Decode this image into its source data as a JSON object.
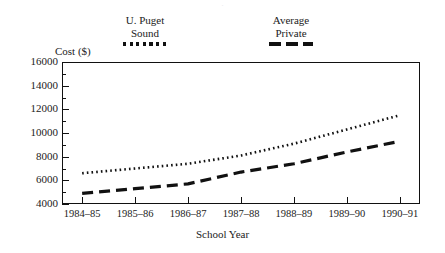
{
  "chart_data": {
    "type": "line",
    "title": "",
    "xlabel": "School Year",
    "ylabel": "Cost ($)",
    "categories": [
      "1984–85",
      "1985–86",
      "1986–87",
      "1987–88",
      "1988–89",
      "1989–90",
      "1990–91"
    ],
    "ylim": [
      4000,
      16000
    ],
    "ytick_values": [
      4000,
      6000,
      8000,
      10000,
      12000,
      14000,
      16000
    ],
    "ytick_labels": [
      "4000",
      "6000",
      "8000",
      "10000",
      "12000",
      "14000",
      "16000"
    ],
    "yminor_step": 1000,
    "grid": false,
    "legend_position": "above-plot",
    "series": [
      {
        "name": "U. Puget Sound",
        "legend_line1": "U. Puget",
        "legend_line2": "Sound",
        "style": "dotted",
        "color": "#111111",
        "values": [
          6600,
          7000,
          7400,
          8100,
          9100,
          10300,
          11500
        ]
      },
      {
        "name": "Average Private",
        "legend_line1": "Average",
        "legend_line2": "Private",
        "style": "dashed",
        "color": "#111111",
        "values": [
          4900,
          5300,
          5700,
          6700,
          7400,
          8400,
          9300
        ]
      }
    ]
  },
  "axes": {
    "frame_color": "#111111",
    "background": "#ffffff"
  },
  "artifact": {
    "top_clipped_text": "·"
  }
}
